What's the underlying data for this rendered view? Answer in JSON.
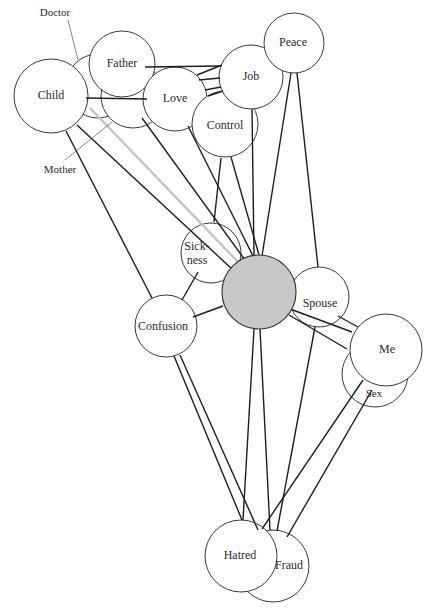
{
  "diagram": {
    "title": "",
    "center_node": {
      "id": "center",
      "label": "",
      "cx": 259,
      "cy": 292,
      "r": 37,
      "fill": "#c8c8c8"
    },
    "nodes": [
      {
        "id": "doctor",
        "label": "Doctor",
        "cx": 98,
        "cy": 86,
        "r": 32,
        "label_x": 55,
        "label_y": 13,
        "leader": [
          68,
          20,
          78,
          60
        ]
      },
      {
        "id": "mother",
        "label": "Mother",
        "cx": 133,
        "cy": 96,
        "r": 32,
        "label_x": 60,
        "label_y": 170,
        "leader": [
          65,
          160,
          112,
          122
        ]
      },
      {
        "id": "child",
        "label": "Child",
        "cx": 51,
        "cy": 96,
        "r": 37,
        "label_x": 51,
        "label_y": 96
      },
      {
        "id": "father",
        "label": "Father",
        "cx": 122,
        "cy": 64,
        "r": 33,
        "label_x": 122,
        "label_y": 64
      },
      {
        "id": "love",
        "label": "Love",
        "cx": 175,
        "cy": 99,
        "r": 32,
        "label_x": 175,
        "label_y": 99
      },
      {
        "id": "control",
        "label": "Control",
        "cx": 225,
        "cy": 124,
        "r": 33,
        "label_x": 225,
        "label_y": 126
      },
      {
        "id": "job",
        "label": "Job",
        "cx": 251,
        "cy": 77,
        "r": 32,
        "label_x": 251,
        "label_y": 77
      },
      {
        "id": "peace",
        "label": "Peace",
        "cx": 294,
        "cy": 43,
        "r": 30,
        "label_x": 293,
        "label_y": 43
      },
      {
        "id": "sickness",
        "label": "Sick-",
        "label2": "ness",
        "cx": 211,
        "cy": 253,
        "r": 30,
        "label_x": 197,
        "label_y": 254
      },
      {
        "id": "confusion",
        "label": "Confusion",
        "cx": 166,
        "cy": 326,
        "r": 31,
        "label_x": 163,
        "label_y": 327
      },
      {
        "id": "spouse",
        "label": "Spouse",
        "cx": 319,
        "cy": 297,
        "r": 30,
        "label_x": 320,
        "label_y": 304
      },
      {
        "id": "sex",
        "label": "Sex",
        "cx": 375,
        "cy": 374,
        "r": 33,
        "label_x": 374,
        "label_y": 394
      },
      {
        "id": "me",
        "label": "Me",
        "cx": 386,
        "cy": 350,
        "r": 36,
        "label_x": 387,
        "label_y": 350
      },
      {
        "id": "fraud",
        "label": "Fraud",
        "cx": 273,
        "cy": 566,
        "r": 36,
        "label_x": 289,
        "label_y": 566
      },
      {
        "id": "hatred",
        "label": "Hatred",
        "cx": 241,
        "cy": 556,
        "r": 36,
        "label_x": 240,
        "label_y": 556
      }
    ],
    "edges": [
      {
        "from": "child",
        "to": "love",
        "x1": 86,
        "y1": 98,
        "x2": 147,
        "y2": 99,
        "style": "dark"
      },
      {
        "from": "father",
        "to": "job",
        "x1": 145,
        "y1": 67,
        "x2": 220,
        "y2": 66,
        "style": "dark"
      },
      {
        "from": "love",
        "to": "job",
        "x1": 197,
        "y1": 75,
        "x2": 222,
        "y2": 65,
        "style": "dark"
      },
      {
        "from": "love",
        "to": "job-b",
        "x1": 199,
        "y1": 80,
        "x2": 220,
        "y2": 78,
        "style": "dark"
      },
      {
        "from": "love",
        "to": "job-c",
        "x1": 205,
        "y1": 90,
        "x2": 221,
        "y2": 87,
        "style": "dark"
      },
      {
        "from": "love",
        "to": "job-d",
        "x1": 208,
        "y1": 96,
        "x2": 223,
        "y2": 91,
        "style": "dark"
      },
      {
        "from": "child",
        "to": "center",
        "x1": 77,
        "y1": 125,
        "x2": 233,
        "y2": 270,
        "style": "dark"
      },
      {
        "from": "mother",
        "to": "center",
        "x1": 90,
        "y1": 108,
        "x2": 240,
        "y2": 264,
        "style": "gray"
      },
      {
        "from": "love",
        "to": "center",
        "x1": 142,
        "y1": 118,
        "x2": 245,
        "y2": 260,
        "style": "dark"
      },
      {
        "from": "love-b",
        "to": "center",
        "x1": 188,
        "y1": 126,
        "x2": 253,
        "y2": 256,
        "style": "dark"
      },
      {
        "from": "control",
        "to": "center",
        "x1": 231,
        "y1": 157,
        "x2": 259,
        "y2": 255,
        "style": "dark"
      },
      {
        "from": "control",
        "to": "sickness",
        "x1": 221,
        "y1": 158,
        "x2": 214,
        "y2": 222,
        "style": "dark"
      },
      {
        "from": "job",
        "to": "center",
        "x1": 252,
        "y1": 109,
        "x2": 254,
        "y2": 255,
        "style": "dark"
      },
      {
        "from": "peace",
        "to": "center",
        "x1": 291,
        "y1": 73,
        "x2": 262,
        "y2": 256,
        "style": "dark"
      },
      {
        "from": "peace",
        "to": "spouse",
        "x1": 297,
        "y1": 73,
        "x2": 318,
        "y2": 267,
        "style": "dark"
      },
      {
        "from": "child",
        "to": "confusion",
        "x1": 66,
        "y1": 131,
        "x2": 152,
        "y2": 298,
        "style": "dark"
      },
      {
        "from": "sickness",
        "to": "confusion",
        "x1": 198,
        "y1": 272,
        "x2": 182,
        "y2": 300,
        "style": "dark"
      },
      {
        "from": "confusion",
        "to": "center",
        "x1": 193,
        "y1": 317,
        "x2": 223,
        "y2": 306,
        "style": "dark"
      },
      {
        "from": "center",
        "to": "me",
        "x1": 282,
        "y1": 306,
        "x2": 352,
        "y2": 332,
        "style": "dark"
      },
      {
        "from": "center",
        "to": "me-b",
        "x1": 289,
        "y1": 315,
        "x2": 347,
        "y2": 349,
        "style": "dark"
      },
      {
        "from": "spouse",
        "to": "me",
        "x1": 338,
        "y1": 316,
        "x2": 358,
        "y2": 327,
        "style": "dark"
      },
      {
        "from": "confusion",
        "to": "hatred",
        "x1": 174,
        "y1": 356,
        "x2": 242,
        "y2": 520,
        "style": "dark"
      },
      {
        "from": "confusion",
        "to": "fraud",
        "x1": 180,
        "y1": 355,
        "x2": 258,
        "y2": 530,
        "style": "dark"
      },
      {
        "from": "center",
        "to": "hatred",
        "x1": 254,
        "y1": 329,
        "x2": 243,
        "y2": 520,
        "style": "dark"
      },
      {
        "from": "center",
        "to": "fraud",
        "x1": 260,
        "y1": 329,
        "x2": 270,
        "y2": 530,
        "style": "dark"
      },
      {
        "from": "spouse",
        "to": "fraud",
        "x1": 315,
        "y1": 327,
        "x2": 277,
        "y2": 531,
        "style": "dark"
      },
      {
        "from": "sex",
        "to": "hatred",
        "x1": 363,
        "y1": 380,
        "x2": 262,
        "y2": 529,
        "style": "dark"
      },
      {
        "from": "sex",
        "to": "fraud",
        "x1": 372,
        "y1": 390,
        "x2": 287,
        "y2": 537,
        "style": "dark"
      }
    ]
  }
}
